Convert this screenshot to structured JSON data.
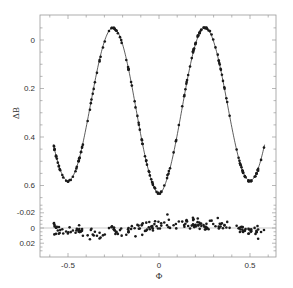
{
  "chart_data": [
    {
      "type": "scatter",
      "panel": "light-curve",
      "title": "",
      "xlabel": "Φ",
      "ylabel": "ΔB",
      "xlim": [
        -0.63,
        0.64
      ],
      "ylim": [
        0.645,
        -0.1
      ],
      "y_inverted": true,
      "grid": false,
      "yticks": [
        0,
        0.2,
        0.4,
        0.6
      ],
      "ytick_labels": [
        "0",
        "0.2",
        "0.4",
        "0.6"
      ],
      "xticks": [
        -0.5,
        0,
        0.5
      ],
      "xtick_labels": [
        "-0.5",
        "0",
        "0.5"
      ],
      "features": {
        "max1": {
          "phase": -0.26,
          "dB": -0.065
        },
        "max2": {
          "phase": 0.26,
          "dB": -0.06
        },
        "primary_min": {
          "phase": 0.0,
          "dB": 0.62
        },
        "secondary_min_left": {
          "phase": -0.5,
          "dB": 0.58
        },
        "secondary_min_right": {
          "phase": 0.5,
          "dB": 0.58
        }
      },
      "series": [
        {
          "name": "observations",
          "style": "points",
          "phase_range": [
            -0.58,
            0.58
          ],
          "count": 200
        },
        {
          "name": "model fit",
          "style": "solid-line"
        }
      ]
    },
    {
      "type": "scatter",
      "panel": "residuals",
      "xlabel": "Φ",
      "ylabel": "",
      "ylim": [
        0.033,
        -0.035
      ],
      "yticks": [
        -0.02,
        0,
        0.02
      ],
      "ytick_labels": [
        "-0.02",
        "0",
        "0.02"
      ],
      "reference_line": 0,
      "series": [
        {
          "name": "O-C residuals",
          "style": "points",
          "scatter_sigma": 0.012
        }
      ]
    }
  ],
  "axes": {
    "x_label": "Φ",
    "y_label": "ΔB",
    "upper_yticks": [
      "0",
      "0.2",
      "0.4",
      "0.6"
    ],
    "lower_yticks": [
      "-0.02",
      "0",
      "0.02"
    ],
    "xticks": [
      "-0.5",
      "0",
      "0.5"
    ]
  },
  "colors": {
    "points": "#1a1a1a",
    "line": "#333333",
    "frame": "#999999",
    "zero_line": "#bbbbbb"
  }
}
